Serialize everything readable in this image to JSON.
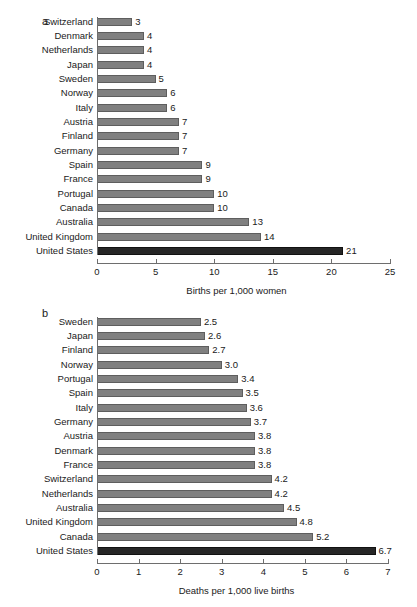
{
  "figure": {
    "background": "#ffffff",
    "bar_color": "#808080",
    "bar_border_color": "#5e5e5e",
    "highlight_color": "#262626",
    "axis_color": "#6e6e6e",
    "text_color": "#1a1a1a"
  },
  "panels": {
    "a": {
      "letter": "a",
      "xlabel": "Births per 1,000 women",
      "ticks": [
        "0",
        "5",
        "10",
        "15",
        "20",
        "25"
      ]
    },
    "b": {
      "letter": "b",
      "xlabel": "Deaths per 1,000 live births",
      "ticks": [
        "0",
        "1",
        "2",
        "3",
        "4",
        "5",
        "6",
        "7"
      ]
    }
  },
  "chart_data": [
    {
      "type": "bar",
      "orientation": "horizontal",
      "panel": "a",
      "title": "",
      "xlabel": "Births per 1,000 women",
      "ylabel": "",
      "xlim": [
        0,
        25
      ],
      "xticks": [
        0,
        5,
        10,
        15,
        20,
        25
      ],
      "grid": false,
      "legend": false,
      "highlight_category": "United States",
      "categories": [
        "Switzerland",
        "Denmark",
        "Netherlands",
        "Japan",
        "Sweden",
        "Norway",
        "Italy",
        "Austria",
        "Finland",
        "Germany",
        "Spain",
        "France",
        "Portugal",
        "Canada",
        "Australia",
        "United Kingdom",
        "United States"
      ],
      "values": [
        3,
        4,
        4,
        4,
        5,
        6,
        6,
        7,
        7,
        7,
        9,
        9,
        10,
        10,
        13,
        14,
        21
      ],
      "value_labels": [
        "3",
        "4",
        "4",
        "4",
        "5",
        "6",
        "6",
        "7",
        "7",
        "7",
        "9",
        "9",
        "10",
        "10",
        "13",
        "14",
        "21"
      ]
    },
    {
      "type": "bar",
      "orientation": "horizontal",
      "panel": "b",
      "title": "",
      "xlabel": "Deaths per 1,000 live births",
      "ylabel": "",
      "xlim": [
        0,
        7
      ],
      "xticks": [
        0,
        1,
        2,
        3,
        4,
        5,
        6,
        7
      ],
      "grid": false,
      "legend": false,
      "highlight_category": "United States",
      "categories": [
        "Sweden",
        "Japan",
        "Finland",
        "Norway",
        "Portugal",
        "Spain",
        "Italy",
        "Germany",
        "Austria",
        "Denmark",
        "France",
        "Switzerland",
        "Netherlands",
        "Australia",
        "United Kingdom",
        "Canada",
        "United States"
      ],
      "values": [
        2.5,
        2.6,
        2.7,
        3.0,
        3.4,
        3.5,
        3.6,
        3.7,
        3.8,
        3.8,
        3.8,
        4.2,
        4.2,
        4.5,
        4.8,
        5.2,
        6.7
      ],
      "value_labels": [
        "2.5",
        "2.6",
        "2.7",
        "3.0",
        "3.4",
        "3.5",
        "3.6",
        "3.7",
        "3.8",
        "3.8",
        "3.8",
        "4.2",
        "4.2",
        "4.5",
        "4.8",
        "5.2",
        "6.7"
      ]
    }
  ]
}
